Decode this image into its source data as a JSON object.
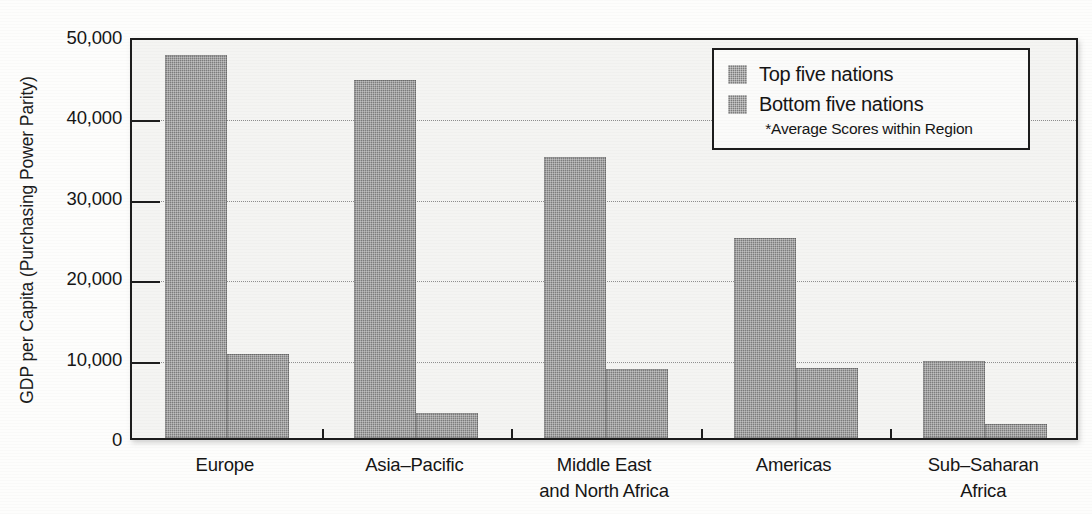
{
  "chart_data": {
    "type": "bar",
    "title": "",
    "xlabel": "",
    "ylabel": "GDP per Capita (Purchasing Power Parity)",
    "categories": [
      "Europe",
      "Asia–Pacific",
      "Middle East\nand North Africa",
      "Americas",
      "Sub–Saharan\nAfrica"
    ],
    "category_lines": [
      [
        "Europe"
      ],
      [
        "Asia–Pacific"
      ],
      [
        "Middle East",
        "and North Africa"
      ],
      [
        "Americas"
      ],
      [
        "Sub–Saharan",
        "Africa"
      ]
    ],
    "series": [
      {
        "name": "Top five nations",
        "values": [
          47700,
          44500,
          35000,
          24900,
          9600
        ]
      },
      {
        "name": "Bottom five nations",
        "values": [
          10400,
          3100,
          8600,
          8700,
          1700
        ]
      }
    ],
    "ylim": [
      0,
      50000
    ],
    "yticks": [
      0,
      10000,
      20000,
      30000,
      40000,
      50000
    ],
    "ytick_labels": [
      "0",
      "10,000",
      "20,000",
      "30,000",
      "40,000",
      "50,000"
    ],
    "grid": true,
    "grid_axis": "y",
    "legend_position": "upper right",
    "legend_note": "*Average Scores within Region",
    "bar_color": "#7d7d7d",
    "axis_color": "#1d1d1d",
    "plot_background": "#f4f4f2"
  },
  "legend": {
    "items": [
      {
        "label": "Top five nations"
      },
      {
        "label": "Bottom five nations"
      }
    ],
    "note": "*Average Scores within Region"
  }
}
